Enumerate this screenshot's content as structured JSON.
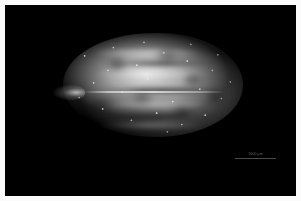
{
  "figure": {
    "kind": "darkfield-micrograph",
    "background_color": "#000000",
    "frame_color": "#fbfbfb"
  },
  "specimen": {
    "name": "seed-specimen",
    "outline_shape": "lenticular-ovoid",
    "apex": "pointed beak at left",
    "base": "broadly rounded at right",
    "surface": "granular papillate with longitudinal ridges and grooves",
    "highlight_color": "#e8e8e8",
    "shadow_color": "#000000",
    "ridge_count": 4,
    "groove_count": 3
  },
  "scalebar": {
    "label": "1000 µm",
    "line_color": "#4a4a4a",
    "label_color": "#6b6b6b",
    "length_px": 41,
    "position": "bottom-right"
  }
}
